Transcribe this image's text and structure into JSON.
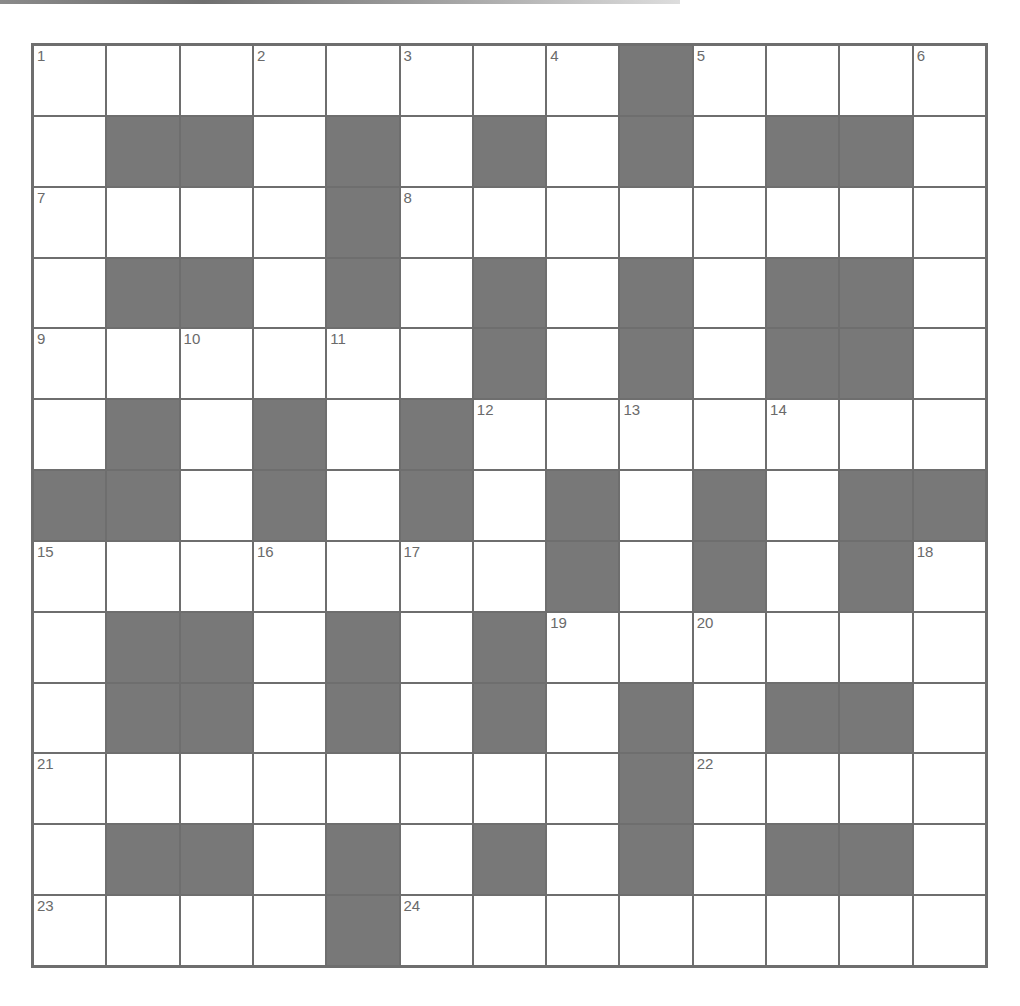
{
  "puzzle": {
    "rows": 13,
    "cols": 13,
    "colors": {
      "black_cell": "#787878",
      "white_cell": "#ffffff",
      "grid_line": "#6e6e6e",
      "number_text": "#6a6a6a"
    },
    "layout": [
      "1,.,.,2,.,3,.,4,#,5,.,.,6",
      ".,#,#,.,#,.,#,.,#,.,#,#,.",
      "7,.,.,.,#,8,.,.,.,.,.,.,.",
      ".,#,#,.,#,.,#,.,#,.,#,#,.",
      "9,.,10,.,11,.,#,.,#,.,#,#,.",
      ".,#,.,#,.,#,12,.,13,.,14,.,.",
      "#,#,.,#,.,#,.,#,.,#,.,#,#",
      "15,.,.,16,.,17,.,#,.,#,.,#,18",
      ".,#,#,.,#,.,#,19,.,20,.,.,.",
      ".,#,#,.,#,.,#,.,#,.,#,#,.",
      "21,.,.,.,.,.,.,.,#,22,.,.,.",
      ".,#,#,.,#,.,#,.,#,.,#,#,.",
      "23,.,.,.,#,24,.,.,.,.,.,.,."
    ],
    "clue_numbers": [
      "1",
      "2",
      "3",
      "4",
      "5",
      "6",
      "7",
      "8",
      "9",
      "10",
      "11",
      "12",
      "13",
      "14",
      "15",
      "16",
      "17",
      "18",
      "19",
      "20",
      "21",
      "22",
      "23",
      "24"
    ]
  }
}
